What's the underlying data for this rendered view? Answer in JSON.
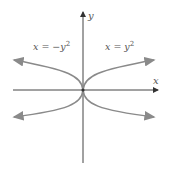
{
  "diagram": {
    "axes": {
      "x_label": "x",
      "y_label": "y"
    },
    "curves": [
      {
        "label": "x = −y",
        "exp": "2",
        "side": "left"
      },
      {
        "label": "x = y",
        "exp": "2",
        "side": "right"
      }
    ],
    "colors": {
      "axis": "#555555",
      "curve": "#8a8a8a",
      "text": "#666666"
    }
  }
}
